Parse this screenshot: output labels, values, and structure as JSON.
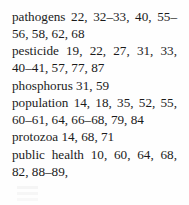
{
  "page": {
    "kind": "book-index-fragment",
    "background_color": "#fefefe",
    "text_color": "#1b1b1b"
  },
  "index": {
    "entries": [
      {
        "term": "pathogens",
        "locators": "22, 32–33, 40, 55–56, 58, 62, 68",
        "full_text": "pathogens 22, 32–33, 40, 55–56, 58, 62, 68"
      },
      {
        "term": "pesticide",
        "locators": "19, 22, 27, 31, 33, 40–41, 57, 77, 87",
        "full_text": "pesticide 19, 22, 27, 31, 33, 40–41, 57, 77, 87"
      },
      {
        "term": "phosphorus",
        "locators": "31, 59",
        "full_text": "phosphorus 31, 59"
      },
      {
        "term": "population",
        "locators": "14, 18, 35, 52, 55, 60–61, 64, 66–68, 79, 84",
        "full_text": "population 14, 18, 35, 52, 55, 60–61, 64, 66–68, 79, 84"
      },
      {
        "term": "protozoa",
        "locators": "14, 68, 71",
        "full_text": "protozoa 14, 68, 71"
      },
      {
        "term": "public health",
        "locators": "10, 60, 64, 68, 82, 88–89,",
        "full_text": "public health 10, 60, 64, 68, 82, 88–89,"
      }
    ]
  }
}
